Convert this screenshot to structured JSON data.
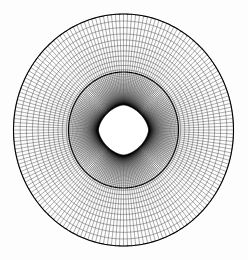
{
  "figure": {
    "background_color": "#fdfdfd",
    "line_color": "#000000",
    "body_fill_color": "#ffffff",
    "width": 248,
    "height": 260
  },
  "chart_data": {
    "type": "diagram",
    "subtype": "computational-mesh",
    "xlabel": "",
    "ylabel": "",
    "grid": true,
    "legend": false,
    "center": {
      "x": 123.5,
      "y": 130.0
    },
    "outer_boundary": {
      "name": "far-field-circle",
      "shape": "ellipse",
      "rx": 110.0,
      "ry": 116.0,
      "stroke": "#000000",
      "stroke_width": 1.1
    },
    "interface_boundary": {
      "name": "inner-interface-circle",
      "shape": "ellipse",
      "rx": 55.0,
      "ry": 58.0,
      "stroke": "#000000",
      "stroke_width": 1.1
    },
    "inner_body": {
      "name": "four-pointed-star",
      "shape": "astroid",
      "tip_radius_x": 28.0,
      "tip_radius_y": 28.0,
      "waist_radius": 9.0,
      "points": 4,
      "orientation_deg": 0,
      "fill": "#ffffff",
      "stroke": "#000000",
      "stroke_width": 1.0
    },
    "mesh": {
      "topology": "O-grid",
      "n_circumferential": 180,
      "n_radial": 74,
      "radial_clustering": "geometric-stretch-outward",
      "first_cell_height": 0.85,
      "stretch_ratio": 1.055,
      "outer_cell_size_px": 5.0,
      "inner_cell_size_px": 1.0,
      "line_width_px": 0.35,
      "line_color": "#000000"
    },
    "annotations": []
  }
}
